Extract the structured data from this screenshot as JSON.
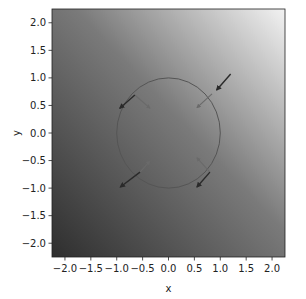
{
  "chart_data": {
    "type": "quiver",
    "title": "",
    "xlabel": "x",
    "ylabel": "y",
    "xlim": [
      -2.25,
      2.25
    ],
    "ylim": [
      -2.25,
      2.25
    ],
    "xticks": [
      "−2.0",
      "−1.5",
      "−1.0",
      "−0.5",
      "0.0",
      "0.5",
      "1.0",
      "1.5",
      "2.0"
    ],
    "yticks": [
      "2.0",
      "1.5",
      "1.0",
      "0.5",
      "0.0",
      "−0.5",
      "−1.0",
      "−1.5",
      "−2.0"
    ],
    "xtick_values": [
      -2.0,
      -1.5,
      -1.0,
      -0.5,
      0.0,
      0.5,
      1.0,
      1.5,
      2.0
    ],
    "ytick_values": [
      2.0,
      1.5,
      1.0,
      0.5,
      0.0,
      -0.5,
      -1.0,
      -1.5,
      -2.0
    ],
    "grid": false,
    "background": {
      "type": "diagonal-gradient",
      "low_color": "#2e2e2e",
      "high_color": "#f2f2f2",
      "direction": "bottom-left to top-right"
    },
    "circle": {
      "center": [
        0,
        0
      ],
      "radius": 1.0,
      "color": "#555555"
    },
    "arrows": {
      "field": {
        "color": "#2a2a2a",
        "items": [
          {
            "x": 1.2,
            "y": 1.07,
            "dx": -0.27,
            "dy": -0.29
          },
          {
            "x": -0.65,
            "y": 0.69,
            "dx": -0.29,
            "dy": -0.24
          },
          {
            "x": -0.55,
            "y": -0.71,
            "dx": -0.38,
            "dy": -0.27
          },
          {
            "x": 0.8,
            "y": -0.71,
            "dx": -0.25,
            "dy": -0.27
          }
        ]
      },
      "normal": {
        "color": "#6a6a6a",
        "items": [
          {
            "x": 0.84,
            "y": 0.71,
            "dx": -0.29,
            "dy": -0.25
          },
          {
            "x": -0.65,
            "y": 0.69,
            "dx": 0.29,
            "dy": -0.24
          },
          {
            "x": -0.55,
            "y": -0.71,
            "dx": 0.19,
            "dy": 0.2
          },
          {
            "x": 0.8,
            "y": -0.71,
            "dx": -0.25,
            "dy": 0.26
          }
        ]
      }
    }
  }
}
